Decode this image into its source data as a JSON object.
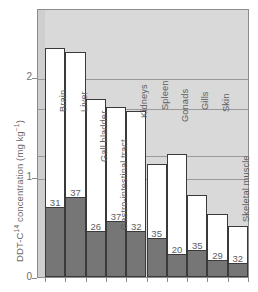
{
  "chart_data": {
    "type": "bar",
    "title": "",
    "subtitle": "",
    "xlabel": "",
    "ylabel": "DDT-C14 concentration (mg kg-1)",
    "ylabel_html": "DDT-C<sup>14</sup> concentration (mg kg<sup>−1</sup>)",
    "ylim": [
      0,
      2.42
    ],
    "yticks": [
      0,
      1,
      2
    ],
    "ytick_labels": [
      "0",
      "1",
      "2"
    ],
    "grid": true,
    "legend": "none",
    "categories": [
      "Brain",
      "Liver",
      "Gall bladder",
      "Gastro-intestinal tract",
      "Kidneys",
      "Spleen",
      "Gonads",
      "Gills",
      "Skin",
      "Skeletal muscle"
    ],
    "series": [
      {
        "name": "Total DDT-C14 concentration",
        "style": "open-white-bar",
        "values": [
          2.29,
          2.25,
          1.78,
          1.7,
          1.66,
          1.13,
          1.23,
          0.82,
          0.63,
          0.51
        ]
      },
      {
        "name": "Shaded lower portion",
        "style": "filled-grey-bar",
        "values": [
          0.7,
          0.8,
          0.46,
          0.56,
          0.46,
          0.39,
          0.23,
          0.27,
          0.17,
          0.14
        ]
      }
    ],
    "bar_labels": [
      "31",
      "37",
      "26",
      "37",
      "32",
      "35",
      "20",
      "35",
      "29",
      "32"
    ],
    "colors": {
      "plot_background": "#d9d9d9",
      "bar_open": "#ffffff",
      "bar_shaded": "#767676",
      "bar_outline": "#3a3a3a",
      "gridline": "#9a9a9a",
      "axis": "#8c8c8c",
      "text": "#5e5e5e"
    }
  }
}
